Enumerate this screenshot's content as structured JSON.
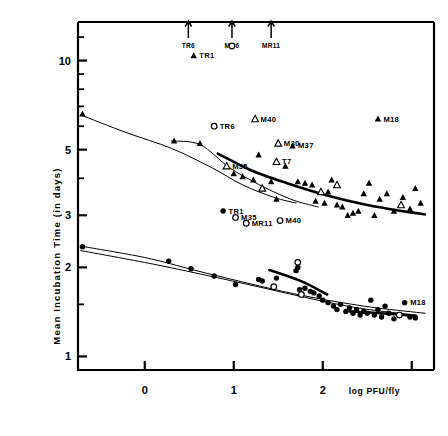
{
  "chart_data": {
    "type": "scatter",
    "title": "",
    "xlabel": "log PFU/fly",
    "ylabel": "Mean Incubation Time  (in days)",
    "yscale": "log",
    "ylim": [
      0.9,
      13.5
    ],
    "xlim": [
      -0.75,
      3.25
    ],
    "grid": false,
    "legend": "none",
    "xticks": [
      0,
      1,
      2,
      3
    ],
    "xtick_labels": [
      "0",
      "1",
      "2",
      ""
    ],
    "yticks": [
      1,
      2,
      3,
      5,
      10
    ],
    "ytick_labels": [
      "1",
      "2",
      "3",
      "5",
      "10"
    ],
    "yminor_ticks": [
      1.5,
      4,
      6,
      7,
      8,
      9,
      12
    ],
    "annotations_top_arrows": [
      {
        "label": "TR6",
        "x": 0.49
      },
      {
        "label": "MR6",
        "x": 0.98
      },
      {
        "label": "MR11",
        "x": 1.42
      }
    ],
    "series": [
      {
        "name": "filled-triangle",
        "marker": "filled-triangle",
        "points": [
          {
            "x": 0.55,
            "y": 10.4,
            "label": "TR1"
          },
          {
            "x": 2.62,
            "y": 6.35,
            "label": "M18"
          },
          {
            "x": 1.66,
            "y": 5.15,
            "label": "M37"
          },
          {
            "x": -0.7,
            "y": 6.6,
            "label": ""
          },
          {
            "x": 0.33,
            "y": 5.35,
            "label": ""
          },
          {
            "x": 0.62,
            "y": 5.25,
            "label": ""
          },
          {
            "x": 1.0,
            "y": 4.15,
            "label": ""
          },
          {
            "x": 1.1,
            "y": 4.05,
            "label": ""
          },
          {
            "x": 1.28,
            "y": 4.8,
            "label": ""
          },
          {
            "x": 1.22,
            "y": 3.95,
            "label": ""
          },
          {
            "x": 1.42,
            "y": 3.9,
            "label": ""
          },
          {
            "x": 1.58,
            "y": 4.4,
            "label": ""
          },
          {
            "x": 1.72,
            "y": 3.9,
            "label": ""
          },
          {
            "x": 1.8,
            "y": 3.85,
            "label": ""
          },
          {
            "x": 1.88,
            "y": 3.8,
            "label": ""
          },
          {
            "x": 1.92,
            "y": 3.35,
            "label": ""
          },
          {
            "x": 2.02,
            "y": 3.3,
            "label": ""
          },
          {
            "x": 2.1,
            "y": 3.95,
            "label": ""
          },
          {
            "x": 2.16,
            "y": 3.25,
            "label": ""
          },
          {
            "x": 2.22,
            "y": 3.2,
            "label": ""
          },
          {
            "x": 2.28,
            "y": 3.0,
            "label": ""
          },
          {
            "x": 2.34,
            "y": 3.05,
            "label": ""
          },
          {
            "x": 2.4,
            "y": 3.1,
            "label": ""
          },
          {
            "x": 2.46,
            "y": 3.55,
            "label": ""
          },
          {
            "x": 2.52,
            "y": 3.85,
            "label": ""
          },
          {
            "x": 2.58,
            "y": 3.0,
            "label": ""
          },
          {
            "x": 2.64,
            "y": 3.4,
            "label": ""
          },
          {
            "x": 2.72,
            "y": 3.55,
            "label": ""
          },
          {
            "x": 2.8,
            "y": 3.1,
            "label": ""
          },
          {
            "x": 2.9,
            "y": 3.45,
            "label": ""
          },
          {
            "x": 2.98,
            "y": 3.15,
            "label": ""
          },
          {
            "x": 3.04,
            "y": 3.7,
            "label": ""
          },
          {
            "x": 3.1,
            "y": 3.3,
            "label": ""
          },
          {
            "x": 1.48,
            "y": 3.4,
            "label": ""
          },
          {
            "x": 2.06,
            "y": 3.6,
            "label": ""
          }
        ]
      },
      {
        "name": "open-triangle",
        "marker": "open-triangle",
        "points": [
          {
            "x": 1.24,
            "y": 6.35,
            "label": "M40"
          },
          {
            "x": 1.5,
            "y": 5.25,
            "label": "M30"
          },
          {
            "x": 1.48,
            "y": 4.55,
            "label": "T7"
          },
          {
            "x": 0.92,
            "y": 4.4,
            "label": "M35"
          },
          {
            "x": 1.32,
            "y": 3.7,
            "label": ""
          },
          {
            "x": 2.16,
            "y": 3.8,
            "label": ""
          },
          {
            "x": 2.88,
            "y": 3.25,
            "label": ""
          },
          {
            "x": 1.98,
            "y": 3.6,
            "label": ""
          }
        ]
      },
      {
        "name": "filled-circle",
        "marker": "filled-circle",
        "points": [
          {
            "x": 0.88,
            "y": 3.1,
            "label": "TR1"
          },
          {
            "x": 2.92,
            "y": 1.52,
            "label": "M18"
          },
          {
            "x": -0.7,
            "y": 2.35,
            "label": ""
          },
          {
            "x": 0.27,
            "y": 2.1,
            "label": ""
          },
          {
            "x": 0.52,
            "y": 1.98,
            "label": ""
          },
          {
            "x": 0.78,
            "y": 1.87,
            "label": ""
          },
          {
            "x": 1.02,
            "y": 1.75,
            "label": ""
          },
          {
            "x": 1.28,
            "y": 1.82,
            "label": ""
          },
          {
            "x": 1.32,
            "y": 1.8,
            "label": ""
          },
          {
            "x": 1.48,
            "y": 1.84,
            "label": ""
          },
          {
            "x": 1.74,
            "y": 1.68,
            "label": ""
          },
          {
            "x": 1.8,
            "y": 1.7,
            "label": ""
          },
          {
            "x": 1.86,
            "y": 1.66,
            "label": ""
          },
          {
            "x": 1.9,
            "y": 1.64,
            "label": ""
          },
          {
            "x": 1.96,
            "y": 1.6,
            "label": ""
          },
          {
            "x": 2.0,
            "y": 1.55,
            "label": ""
          },
          {
            "x": 2.06,
            "y": 1.52,
            "label": ""
          },
          {
            "x": 2.12,
            "y": 1.48,
            "label": ""
          },
          {
            "x": 2.16,
            "y": 1.44,
            "label": ""
          },
          {
            "x": 2.2,
            "y": 1.5,
            "label": ""
          },
          {
            "x": 2.26,
            "y": 1.42,
            "label": ""
          },
          {
            "x": 2.3,
            "y": 1.46,
            "label": ""
          },
          {
            "x": 2.34,
            "y": 1.4,
            "label": ""
          },
          {
            "x": 2.38,
            "y": 1.44,
            "label": ""
          },
          {
            "x": 2.42,
            "y": 1.38,
            "label": ""
          },
          {
            "x": 2.46,
            "y": 1.42,
            "label": ""
          },
          {
            "x": 2.5,
            "y": 1.4,
            "label": ""
          },
          {
            "x": 2.54,
            "y": 1.55,
            "label": ""
          },
          {
            "x": 2.58,
            "y": 1.38,
            "label": ""
          },
          {
            "x": 2.62,
            "y": 1.44,
            "label": ""
          },
          {
            "x": 2.66,
            "y": 1.36,
            "label": ""
          },
          {
            "x": 2.7,
            "y": 1.48,
            "label": ""
          },
          {
            "x": 2.74,
            "y": 1.4,
            "label": ""
          },
          {
            "x": 2.8,
            "y": 1.34,
            "label": ""
          },
          {
            "x": 2.98,
            "y": 1.36,
            "label": ""
          },
          {
            "x": 3.04,
            "y": 1.35,
            "label": ""
          },
          {
            "x": 1.7,
            "y": 1.95,
            "label": ""
          },
          {
            "x": 1.72,
            "y": 2.0,
            "label": ""
          }
        ]
      },
      {
        "name": "open-circle",
        "marker": "open-circle",
        "points": [
          {
            "x": 0.98,
            "y": 11.2,
            "label": ""
          },
          {
            "x": 0.78,
            "y": 6.0,
            "label": "TR6"
          },
          {
            "x": 1.02,
            "y": 2.95,
            "label": "M35"
          },
          {
            "x": 1.14,
            "y": 2.82,
            "label": "MR11"
          },
          {
            "x": 1.52,
            "y": 2.88,
            "label": "M40"
          },
          {
            "x": 1.45,
            "y": 1.72,
            "label": ""
          },
          {
            "x": 1.72,
            "y": 2.08,
            "label": ""
          },
          {
            "x": 1.76,
            "y": 1.62,
            "label": ""
          },
          {
            "x": 2.86,
            "y": 1.38,
            "label": ""
          }
        ]
      }
    ],
    "fit_curves": [
      {
        "name": "upper-triangle-fit",
        "style": "thin",
        "points": [
          [
            -0.72,
            6.55
          ],
          [
            -0.2,
            5.7
          ],
          [
            0.3,
            5.05
          ],
          [
            0.75,
            4.35
          ],
          [
            1.1,
            3.8
          ],
          [
            1.45,
            3.45
          ],
          [
            1.7,
            3.3
          ]
        ]
      },
      {
        "name": "lower-triangle-fit",
        "style": "thin",
        "points": [
          [
            0.3,
            5.35
          ],
          [
            0.62,
            5.2
          ],
          [
            0.95,
            4.35
          ],
          [
            1.22,
            3.9
          ],
          [
            1.45,
            3.6
          ],
          [
            1.7,
            3.35
          ],
          [
            1.95,
            3.2
          ]
        ]
      },
      {
        "name": "bold-triangle-fit",
        "style": "bold",
        "points": [
          [
            0.82,
            4.85
          ],
          [
            1.2,
            4.25
          ],
          [
            1.6,
            3.85
          ],
          [
            2.05,
            3.5
          ],
          [
            2.5,
            3.25
          ],
          [
            2.95,
            3.08
          ],
          [
            3.15,
            3.02
          ]
        ]
      },
      {
        "name": "upper-circle-fit",
        "style": "thin",
        "points": [
          [
            -0.72,
            2.36
          ],
          [
            0.0,
            2.16
          ],
          [
            0.55,
            1.96
          ],
          [
            1.05,
            1.8
          ],
          [
            1.55,
            1.66
          ],
          [
            2.05,
            1.55
          ],
          [
            2.6,
            1.46
          ],
          [
            3.15,
            1.4
          ]
        ]
      },
      {
        "name": "lower-circle-fit",
        "style": "thin",
        "points": [
          [
            -0.72,
            2.28
          ],
          [
            0.1,
            2.05
          ],
          [
            0.8,
            1.85
          ],
          [
            1.35,
            1.7
          ],
          [
            1.9,
            1.56
          ],
          [
            2.45,
            1.45
          ],
          [
            3.05,
            1.38
          ]
        ]
      },
      {
        "name": "bold-circle-fit",
        "style": "bold",
        "points": [
          [
            1.4,
            1.96
          ],
          [
            1.75,
            1.8
          ],
          [
            2.05,
            1.62
          ]
        ]
      },
      {
        "name": "bold-circle-fit2",
        "style": "bold",
        "points": [
          [
            2.3,
            1.42
          ],
          [
            2.65,
            1.4
          ],
          [
            3.05,
            1.37
          ]
        ]
      }
    ]
  }
}
